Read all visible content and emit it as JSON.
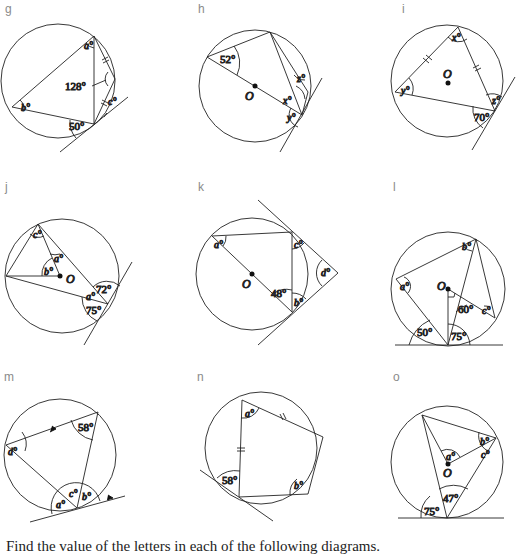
{
  "instruction": "Find the value of the letters in each of the following diagrams.",
  "diagrams": [
    {
      "id": "g",
      "label": "g",
      "given_angles": [
        "128°",
        "50°"
      ],
      "unknowns": [
        "a°",
        "b°",
        "c°"
      ],
      "features": [
        "tangent",
        "equal-chord marks"
      ]
    },
    {
      "id": "h",
      "label": "h",
      "given_angles": [
        "52°"
      ],
      "unknowns": [
        "x°",
        "y°",
        "z°"
      ],
      "center": "O",
      "features": [
        "diameter",
        "tangent"
      ]
    },
    {
      "id": "i",
      "label": "i",
      "given_angles": [
        "70°"
      ],
      "unknowns": [
        "x°",
        "y°",
        "z°"
      ],
      "center": "O",
      "features": [
        "tangent",
        "equal-chord marks"
      ]
    },
    {
      "id": "j",
      "label": "j",
      "given_angles": [
        "72°",
        "75°"
      ],
      "unknowns": [
        "a°",
        "b°",
        "c°",
        "d°"
      ],
      "center": "O",
      "features": [
        "tangent"
      ]
    },
    {
      "id": "k",
      "label": "k",
      "given_angles": [
        "48°"
      ],
      "unknowns": [
        "a°",
        "b°",
        "c°",
        "d°"
      ],
      "center": "O",
      "features": [
        "diameter",
        "two tangents"
      ]
    },
    {
      "id": "l",
      "label": "l",
      "given_angles": [
        "60°",
        "50°",
        "75°"
      ],
      "unknowns": [
        "a°",
        "b°",
        "c°"
      ],
      "center": "O",
      "features": [
        "tangent",
        "right angle"
      ]
    },
    {
      "id": "m",
      "label": "m",
      "given_angles": [
        "58°"
      ],
      "unknowns": [
        "a°",
        "b°",
        "c°",
        "d°"
      ],
      "features": [
        "tangent",
        "parallel arrows"
      ]
    },
    {
      "id": "n",
      "label": "n",
      "given_angles": [
        "58°"
      ],
      "unknowns": [
        "a°",
        "b°"
      ],
      "features": [
        "tangent",
        "equal-chord marks"
      ]
    },
    {
      "id": "o",
      "label": "o",
      "given_angles": [
        "47°",
        "75°"
      ],
      "unknowns": [
        "a°",
        "b°",
        "c°"
      ],
      "center": "O",
      "features": [
        "tangent"
      ]
    }
  ],
  "text": {
    "g_128": "128°",
    "g_50": "50°",
    "g_a": "a°",
    "g_b": "b°",
    "g_c": "c°",
    "h_52": "52°",
    "h_x": "x°",
    "h_y": "y°",
    "h_z": "z°",
    "h_O": "O",
    "i_70": "70°",
    "i_x": "x°",
    "i_y": "y°",
    "i_z": "z°",
    "i_O": "O",
    "j_72": "72°",
    "j_75": "75°",
    "j_a": "a°",
    "j_b": "b°",
    "j_c": "c°",
    "j_d": "d°",
    "j_O": "O",
    "k_48": "48°",
    "k_a": "a°",
    "k_b": "b°",
    "k_c": "c°",
    "k_d": "d°",
    "k_O": "O",
    "l_60": "60°",
    "l_50": "50°",
    "l_75": "75°",
    "l_a": "a°",
    "l_b": "b°",
    "l_c": "c°",
    "l_O": "O",
    "m_58": "58°",
    "m_a": "a°",
    "m_b": "b°",
    "m_c": "c°",
    "m_d": "d°",
    "n_58": "58°",
    "n_a": "a°",
    "n_b": "b°",
    "o_47": "47°",
    "o_75": "75°",
    "o_a": "a°",
    "o_b": "b°",
    "o_c": "c°",
    "o_O": "O"
  }
}
